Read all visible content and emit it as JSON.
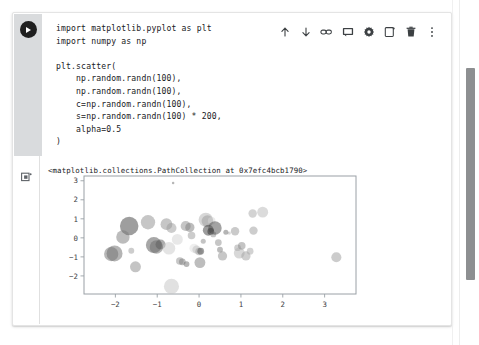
{
  "toolbar": {
    "items": [
      {
        "name": "move-cell-up-icon",
        "label": "Move cell up"
      },
      {
        "name": "move-cell-down-icon",
        "label": "Move cell down"
      },
      {
        "name": "link-to-cell-icon",
        "label": "Link to cell"
      },
      {
        "name": "comment-icon",
        "label": "Add a comment"
      },
      {
        "name": "cell-settings-icon",
        "label": "Cell settings"
      },
      {
        "name": "copy-cell-icon",
        "label": "Copy cell"
      },
      {
        "name": "delete-cell-icon",
        "label": "Delete cell"
      },
      {
        "name": "more-options-icon",
        "label": "More cell actions"
      }
    ]
  },
  "cell": {
    "run_button_label": "Run cell",
    "code": "import matplotlib.pyplot as plt\nimport numpy as np\n\nplt.scatter(\n    np.random.randn(100),\n    np.random.randn(100),\n    c=np.random.randn(100),\n    s=np.random.randn(100) * 200,\n    alpha=0.5\n)"
  },
  "output": {
    "indicator_label": "Output",
    "repr_text": "<matplotlib.collections.PathCollection at 0x7efc4bcb1790>"
  },
  "scrollbar": {
    "label": "Vertical scrollbar"
  },
  "chart_data": {
    "type": "scatter",
    "title": "",
    "xlabel": "",
    "ylabel": "",
    "xlim": [
      -2.75,
      3.75
    ],
    "ylim": [
      -2.95,
      3.25
    ],
    "xticks": [
      -2,
      -1,
      0,
      1,
      2,
      3
    ],
    "yticks": [
      -2,
      -1,
      0,
      1,
      2,
      3
    ],
    "grid": false,
    "legend": null,
    "colormap": "grayscale",
    "alpha": 0.5,
    "points": [
      {
        "x": -0.62,
        "y": 2.88,
        "s": 3,
        "c": "#6e6e6e"
      },
      {
        "x": -1.67,
        "y": 0.62,
        "s": 22,
        "c": "#3d3d3d"
      },
      {
        "x": -1.22,
        "y": 0.82,
        "s": 17,
        "c": "#8d8d8d"
      },
      {
        "x": -1.82,
        "y": 0.04,
        "s": 16,
        "c": "#7a7a7a"
      },
      {
        "x": -2.02,
        "y": -0.82,
        "s": 19,
        "c": "#6a6a6a"
      },
      {
        "x": -1.62,
        "y": -0.68,
        "s": 7,
        "c": "#9b9b9b"
      },
      {
        "x": -1.52,
        "y": -1.52,
        "s": 13,
        "c": "#8a8a8a"
      },
      {
        "x": -1.08,
        "y": -0.38,
        "s": 19,
        "c": "#4f4f4f"
      },
      {
        "x": -1.02,
        "y": -0.48,
        "s": 16,
        "c": "#6b6b6b"
      },
      {
        "x": -0.92,
        "y": -0.35,
        "s": 12,
        "c": "#5c5c5c"
      },
      {
        "x": -0.78,
        "y": 0.72,
        "s": 14,
        "c": "#8e8e8e"
      },
      {
        "x": -0.66,
        "y": 0.52,
        "s": 12,
        "c": "#999999"
      },
      {
        "x": -0.72,
        "y": -0.55,
        "s": 15,
        "c": "#c9c9c9"
      },
      {
        "x": -0.66,
        "y": -2.55,
        "s": 18,
        "c": "#c4c4c4"
      },
      {
        "x": -0.46,
        "y": -1.22,
        "s": 9,
        "c": "#8f8f8f"
      },
      {
        "x": -0.4,
        "y": -1.26,
        "s": 8,
        "c": "#7e7e7e"
      },
      {
        "x": -0.3,
        "y": -1.38,
        "s": 7,
        "c": "#6d6d6d"
      },
      {
        "x": -0.32,
        "y": 0.62,
        "s": 12,
        "c": "#8c8c8c"
      },
      {
        "x": -0.22,
        "y": 0.55,
        "s": 11,
        "c": "#7b7b7b"
      },
      {
        "x": -0.18,
        "y": 0.12,
        "s": 9,
        "c": "#9a9a9a"
      },
      {
        "x": -0.12,
        "y": -0.55,
        "s": 11,
        "c": "#e0e0e0"
      },
      {
        "x": -0.06,
        "y": -0.62,
        "s": 10,
        "c": "#bdbdbd"
      },
      {
        "x": 0.0,
        "y": -0.72,
        "s": 9,
        "c": "#9e9e9e"
      },
      {
        "x": 0.04,
        "y": -0.7,
        "s": 8,
        "c": "#4a4a4a"
      },
      {
        "x": 0.02,
        "y": -1.3,
        "s": 13,
        "c": "#7c7c7c"
      },
      {
        "x": 0.1,
        "y": -0.18,
        "s": 6,
        "c": "#8a8a8a"
      },
      {
        "x": 0.16,
        "y": 0.95,
        "s": 17,
        "c": "#b0b0b0"
      },
      {
        "x": 0.2,
        "y": 0.88,
        "s": 14,
        "c": "#999999"
      },
      {
        "x": 0.3,
        "y": 0.9,
        "s": 9,
        "c": "#d6d6d6"
      },
      {
        "x": 0.22,
        "y": 0.4,
        "s": 13,
        "c": "#3a3a3a"
      },
      {
        "x": 0.28,
        "y": 0.34,
        "s": 8,
        "c": "#2e2e2e"
      },
      {
        "x": 0.34,
        "y": 0.18,
        "s": 7,
        "c": "#8b8b8b"
      },
      {
        "x": 0.38,
        "y": 0.52,
        "s": 16,
        "c": "#484848"
      },
      {
        "x": 0.46,
        "y": -0.25,
        "s": 8,
        "c": "#8d8d8d"
      },
      {
        "x": 0.5,
        "y": -0.62,
        "s": 7,
        "c": "#7a7a7a"
      },
      {
        "x": 0.56,
        "y": -0.95,
        "s": 11,
        "c": "#8f8f8f"
      },
      {
        "x": 0.72,
        "y": 0.25,
        "s": 4,
        "c": "#b5b5b5"
      },
      {
        "x": 0.86,
        "y": 0.35,
        "s": 10,
        "c": "#959595"
      },
      {
        "x": 0.92,
        "y": -0.52,
        "s": 8,
        "c": "#9d9d9d"
      },
      {
        "x": 0.96,
        "y": -0.8,
        "s": 13,
        "c": "#b2b2b2"
      },
      {
        "x": 1.02,
        "y": -0.42,
        "s": 9,
        "c": "#8a8a8a"
      },
      {
        "x": 1.12,
        "y": -0.95,
        "s": 11,
        "c": "#9f9f9f"
      },
      {
        "x": 1.22,
        "y": -0.7,
        "s": 8,
        "c": "#a5a5a5"
      },
      {
        "x": 1.28,
        "y": 1.28,
        "s": 10,
        "c": "#a8a8a8"
      },
      {
        "x": 1.52,
        "y": 1.35,
        "s": 13,
        "c": "#b8b8b8"
      },
      {
        "x": 1.3,
        "y": 0.38,
        "s": 10,
        "c": "#9c9c9c"
      },
      {
        "x": 3.28,
        "y": -1.02,
        "s": 12,
        "c": "#9a9a9a"
      },
      {
        "x": -2.1,
        "y": -0.85,
        "s": 17,
        "c": "#6f6f6f"
      },
      {
        "x": -0.52,
        "y": -0.08,
        "s": 13,
        "c": "#d2d2d2"
      },
      {
        "x": 0.64,
        "y": 0.3,
        "s": 6,
        "c": "#6b6b6b"
      }
    ]
  }
}
